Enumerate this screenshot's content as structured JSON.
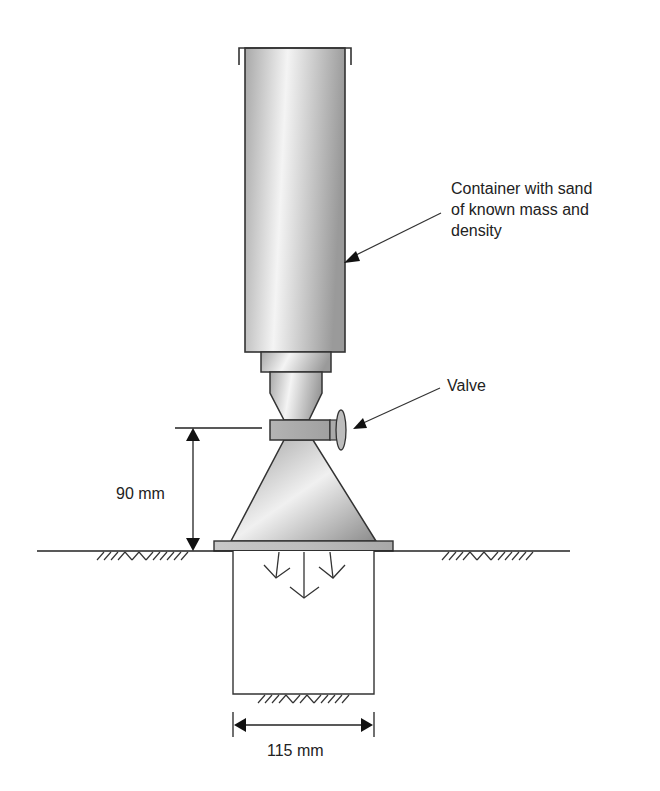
{
  "figure": {
    "type": "apparatus-diagram"
  },
  "labels": {
    "container": [
      "Container with sand",
      "of known mass and",
      "density"
    ],
    "valve": "Valve",
    "height_dimension": "90 mm",
    "width_dimension": "115 mm"
  },
  "components": [
    {
      "name": "sand-container",
      "description": "Cylindrical container filled with sand"
    },
    {
      "name": "collar",
      "description": "Neck collar below container"
    },
    {
      "name": "upper-funnel",
      "description": "Funnel leading to valve"
    },
    {
      "name": "valve",
      "description": "Valve with handle"
    },
    {
      "name": "cone",
      "description": "Conical funnel above base plate"
    },
    {
      "name": "base-plate",
      "description": "Flat plate resting on ground"
    },
    {
      "name": "test-hole",
      "description": "Excavated hole in ground being filled with sand"
    }
  ],
  "dimensions": {
    "cone_height_mm": 90,
    "hole_diameter_mm": 115
  },
  "caption": "",
  "colors": {
    "stroke": "#333333",
    "fill_dark": "#8f8f8f",
    "fill_light": "#f2f2f2",
    "text": "#222222"
  }
}
